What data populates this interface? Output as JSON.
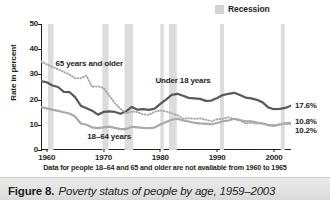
{
  "legend": {
    "label": "Recession",
    "swatch_color": "#d2d2d2",
    "swatch_icon": "square-swatch-icon"
  },
  "footnote": "Data for people 18–64 and 65 and older are not available from 1960 to 1965",
  "caption": {
    "figure_number": "Figure 8.",
    "title": "Poverty status of people by age, 1959–2003"
  },
  "chart_data": {
    "type": "line",
    "title": "Poverty status of people by age, 1959–2003",
    "xlabel": "",
    "ylabel": "Rate in percent",
    "xlim": [
      1959,
      2003
    ],
    "ylim": [
      0,
      50
    ],
    "yticks": [
      0,
      10,
      20,
      30,
      40,
      50
    ],
    "xticks": [
      1960,
      1970,
      1980,
      1990,
      2000
    ],
    "grid": false,
    "legend_position": "top-right",
    "x": [
      1959,
      1960,
      1961,
      1962,
      1963,
      1964,
      1965,
      1966,
      1967,
      1968,
      1969,
      1970,
      1971,
      1972,
      1973,
      1974,
      1975,
      1976,
      1977,
      1978,
      1979,
      1980,
      1981,
      1982,
      1983,
      1984,
      1985,
      1986,
      1987,
      1988,
      1989,
      1990,
      1991,
      1992,
      1993,
      1994,
      1995,
      1996,
      1997,
      1998,
      1999,
      2000,
      2001,
      2002,
      2003
    ],
    "series": [
      {
        "name": "Under 18 years",
        "color": "#58595b",
        "style": "solid",
        "end_label": "17.6%",
        "values": [
          27.3,
          26.9,
          25.6,
          25.0,
          23.1,
          23.0,
          21.0,
          17.6,
          16.6,
          15.6,
          14.0,
          15.1,
          15.3,
          15.1,
          14.4,
          15.4,
          17.1,
          16.0,
          16.2,
          15.9,
          16.4,
          18.3,
          20.0,
          21.9,
          22.3,
          21.5,
          20.7,
          20.5,
          20.3,
          19.5,
          19.6,
          20.6,
          21.8,
          22.3,
          22.7,
          21.8,
          20.8,
          20.5,
          19.9,
          18.9,
          16.9,
          16.2,
          16.3,
          16.7,
          17.6
        ]
      },
      {
        "name": "18–64 years",
        "color": "#a7a9ac",
        "style": "solid",
        "end_label": "10.8%",
        "values": [
          17.0,
          16.5,
          16.0,
          15.5,
          15.0,
          14.5,
          13.3,
          10.5,
          10.0,
          9.0,
          8.7,
          9.0,
          9.3,
          8.8,
          8.3,
          8.3,
          9.2,
          9.0,
          8.8,
          8.7,
          8.9,
          10.1,
          11.1,
          12.0,
          12.4,
          11.7,
          11.3,
          10.8,
          10.6,
          10.5,
          10.2,
          10.7,
          11.4,
          11.7,
          12.4,
          11.9,
          11.4,
          11.4,
          10.9,
          10.5,
          10.0,
          9.6,
          10.1,
          10.6,
          10.8
        ]
      },
      {
        "name": "65 years and older",
        "color": "#a7a9ac",
        "style": "dotted",
        "end_label": "10.2%",
        "values": [
          35.2,
          34.0,
          33.0,
          32.0,
          31.0,
          30.0,
          28.5,
          28.5,
          29.5,
          25.0,
          25.3,
          24.6,
          21.6,
          18.6,
          16.3,
          14.6,
          15.3,
          15.0,
          14.1,
          14.0,
          15.2,
          15.7,
          15.3,
          14.6,
          13.8,
          12.4,
          12.6,
          12.4,
          12.5,
          12.0,
          11.4,
          12.2,
          12.4,
          12.9,
          12.2,
          11.7,
          10.5,
          10.8,
          10.5,
          10.5,
          9.7,
          9.9,
          10.1,
          10.4,
          10.2
        ]
      }
    ],
    "annotations": [
      {
        "text": "65 years and older",
        "x": 1967.5,
        "y": 34.0
      },
      {
        "text": "Under 18 years",
        "x": 1984.0,
        "y": 27.5
      },
      {
        "text": "18–64 years",
        "x": 1971.0,
        "y": 5.0
      }
    ],
    "recession_bands": [
      {
        "start": 1960.25,
        "end": 1961.2
      },
      {
        "start": 1969.8,
        "end": 1970.9
      },
      {
        "start": 1973.7,
        "end": 1975.2
      },
      {
        "start": 1980.0,
        "end": 1980.6
      },
      {
        "start": 1981.5,
        "end": 1982.9
      },
      {
        "start": 1990.5,
        "end": 1991.2
      },
      {
        "start": 2001.2,
        "end": 2001.9
      }
    ],
    "band_color": "#dcdcdc"
  }
}
